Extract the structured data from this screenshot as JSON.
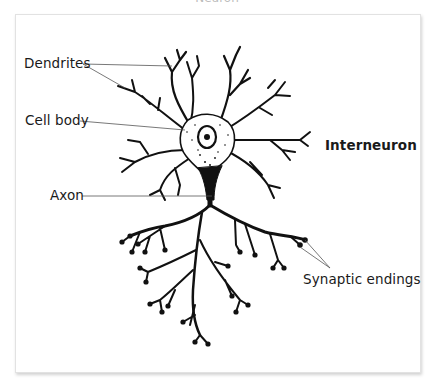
{
  "title": "Neuron",
  "diagram": {
    "subject": "Interneuron",
    "labels": {
      "dendrites": "Dendrites",
      "cell_body": "Cell body",
      "axon": "Axon",
      "interneuron": "Interneuron",
      "synaptic_endings": "Synaptic endings"
    }
  },
  "colors": {
    "ink": "#111111",
    "leader_line": "#555555",
    "frame_border": "#e2e2e2",
    "background": "#ffffff"
  }
}
